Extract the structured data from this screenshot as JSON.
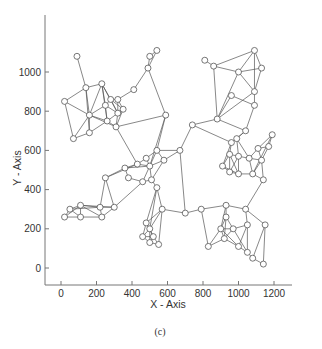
{
  "chart_data": {
    "type": "scatter",
    "subtype": "network-graph",
    "title": "",
    "caption": "(c)",
    "xlabel": "X - Axis",
    "ylabel": "Y - Axis",
    "xlim": [
      -100,
      1400
    ],
    "ylim": [
      -100,
      1250
    ],
    "xticks": [
      0,
      200,
      400,
      600,
      800,
      1000,
      1200
    ],
    "yticks": [
      0,
      200,
      400,
      600,
      800,
      1000
    ],
    "grid": false,
    "legend": null,
    "nodes": [
      {
        "id": 0,
        "x": 90,
        "y": 1080
      },
      {
        "id": 1,
        "x": 20,
        "y": 850
      },
      {
        "id": 2,
        "x": 140,
        "y": 920
      },
      {
        "id": 3,
        "x": 230,
        "y": 940
      },
      {
        "id": 4,
        "x": 160,
        "y": 780
      },
      {
        "id": 5,
        "x": 70,
        "y": 660
      },
      {
        "id": 6,
        "x": 160,
        "y": 690
      },
      {
        "id": 7,
        "x": 250,
        "y": 830
      },
      {
        "id": 8,
        "x": 280,
        "y": 860
      },
      {
        "id": 9,
        "x": 320,
        "y": 860
      },
      {
        "id": 10,
        "x": 350,
        "y": 810
      },
      {
        "id": 11,
        "x": 320,
        "y": 790
      },
      {
        "id": 12,
        "x": 260,
        "y": 750
      },
      {
        "id": 13,
        "x": 310,
        "y": 720
      },
      {
        "id": 14,
        "x": 410,
        "y": 910
      },
      {
        "id": 15,
        "x": 490,
        "y": 1020
      },
      {
        "id": 16,
        "x": 500,
        "y": 1080
      },
      {
        "id": 17,
        "x": 540,
        "y": 1110
      },
      {
        "id": 18,
        "x": 590,
        "y": 780
      },
      {
        "id": 19,
        "x": 810,
        "y": 1060
      },
      {
        "id": 20,
        "x": 860,
        "y": 1030
      },
      {
        "id": 21,
        "x": 1000,
        "y": 1000
      },
      {
        "id": 22,
        "x": 1090,
        "y": 1110
      },
      {
        "id": 23,
        "x": 1130,
        "y": 1020
      },
      {
        "id": 24,
        "x": 1090,
        "y": 900
      },
      {
        "id": 25,
        "x": 960,
        "y": 880
      },
      {
        "id": 26,
        "x": 1090,
        "y": 830
      },
      {
        "id": 27,
        "x": 1040,
        "y": 700
      },
      {
        "id": 28,
        "x": 880,
        "y": 760
      },
      {
        "id": 29,
        "x": 740,
        "y": 730
      },
      {
        "id": 30,
        "x": 990,
        "y": 660
      },
      {
        "id": 31,
        "x": 960,
        "y": 640
      },
      {
        "id": 32,
        "x": 1190,
        "y": 680
      },
      {
        "id": 33,
        "x": 1110,
        "y": 610
      },
      {
        "id": 34,
        "x": 1170,
        "y": 620
      },
      {
        "id": 35,
        "x": 950,
        "y": 580
      },
      {
        "id": 36,
        "x": 1000,
        "y": 570
      },
      {
        "id": 37,
        "x": 1060,
        "y": 560
      },
      {
        "id": 38,
        "x": 1130,
        "y": 550
      },
      {
        "id": 39,
        "x": 910,
        "y": 520
      },
      {
        "id": 40,
        "x": 950,
        "y": 490
      },
      {
        "id": 41,
        "x": 1000,
        "y": 480
      },
      {
        "id": 42,
        "x": 1080,
        "y": 480
      },
      {
        "id": 43,
        "x": 1140,
        "y": 450
      },
      {
        "id": 44,
        "x": 670,
        "y": 600
      },
      {
        "id": 45,
        "x": 580,
        "y": 550
      },
      {
        "id": 46,
        "x": 540,
        "y": 600
      },
      {
        "id": 47,
        "x": 480,
        "y": 560
      },
      {
        "id": 48,
        "x": 500,
        "y": 520
      },
      {
        "id": 49,
        "x": 430,
        "y": 530
      },
      {
        "id": 50,
        "x": 360,
        "y": 510
      },
      {
        "id": 51,
        "x": 380,
        "y": 460
      },
      {
        "id": 52,
        "x": 460,
        "y": 440
      },
      {
        "id": 53,
        "x": 510,
        "y": 450
      },
      {
        "id": 54,
        "x": 540,
        "y": 410
      },
      {
        "id": 55,
        "x": 250,
        "y": 460
      },
      {
        "id": 56,
        "x": 220,
        "y": 310
      },
      {
        "id": 57,
        "x": 300,
        "y": 310
      },
      {
        "id": 58,
        "x": 110,
        "y": 320
      },
      {
        "id": 59,
        "x": 50,
        "y": 300
      },
      {
        "id": 60,
        "x": 20,
        "y": 260
      },
      {
        "id": 61,
        "x": 110,
        "y": 260
      },
      {
        "id": 62,
        "x": 230,
        "y": 260
      },
      {
        "id": 63,
        "x": 570,
        "y": 300
      },
      {
        "id": 64,
        "x": 480,
        "y": 230
      },
      {
        "id": 65,
        "x": 500,
        "y": 200
      },
      {
        "id": 66,
        "x": 460,
        "y": 160
      },
      {
        "id": 67,
        "x": 520,
        "y": 160
      },
      {
        "id": 68,
        "x": 500,
        "y": 130
      },
      {
        "id": 69,
        "x": 550,
        "y": 120
      },
      {
        "id": 70,
        "x": 700,
        "y": 280
      },
      {
        "id": 71,
        "x": 790,
        "y": 300
      },
      {
        "id": 72,
        "x": 930,
        "y": 320
      },
      {
        "id": 73,
        "x": 1040,
        "y": 300
      },
      {
        "id": 74,
        "x": 930,
        "y": 260
      },
      {
        "id": 75,
        "x": 970,
        "y": 200
      },
      {
        "id": 76,
        "x": 900,
        "y": 200
      },
      {
        "id": 77,
        "x": 1050,
        "y": 220
      },
      {
        "id": 78,
        "x": 1150,
        "y": 220
      },
      {
        "id": 79,
        "x": 830,
        "y": 110
      },
      {
        "id": 80,
        "x": 920,
        "y": 150
      },
      {
        "id": 81,
        "x": 1000,
        "y": 110
      },
      {
        "id": 82,
        "x": 1050,
        "y": 80
      },
      {
        "id": 83,
        "x": 1080,
        "y": 50
      },
      {
        "id": 84,
        "x": 1140,
        "y": 20
      }
    ],
    "edges": [
      [
        0,
        2
      ],
      [
        1,
        2
      ],
      [
        1,
        4
      ],
      [
        1,
        5
      ],
      [
        2,
        3
      ],
      [
        2,
        4
      ],
      [
        2,
        6
      ],
      [
        3,
        4
      ],
      [
        3,
        7
      ],
      [
        3,
        8
      ],
      [
        3,
        11
      ],
      [
        3,
        12
      ],
      [
        4,
        5
      ],
      [
        4,
        6
      ],
      [
        4,
        7
      ],
      [
        4,
        12
      ],
      [
        4,
        13
      ],
      [
        5,
        6
      ],
      [
        6,
        12
      ],
      [
        7,
        8
      ],
      [
        7,
        11
      ],
      [
        7,
        12
      ],
      [
        8,
        9
      ],
      [
        8,
        10
      ],
      [
        8,
        11
      ],
      [
        9,
        10
      ],
      [
        9,
        11
      ],
      [
        9,
        14
      ],
      [
        10,
        11
      ],
      [
        10,
        13
      ],
      [
        11,
        12
      ],
      [
        11,
        13
      ],
      [
        12,
        13
      ],
      [
        13,
        18
      ],
      [
        14,
        15
      ],
      [
        15,
        16
      ],
      [
        15,
        17
      ],
      [
        16,
        17
      ],
      [
        15,
        18
      ],
      [
        13,
        49
      ],
      [
        18,
        48
      ],
      [
        18,
        46
      ],
      [
        19,
        20
      ],
      [
        20,
        21
      ],
      [
        20,
        22
      ],
      [
        20,
        28
      ],
      [
        21,
        22
      ],
      [
        21,
        23
      ],
      [
        21,
        24
      ],
      [
        21,
        28
      ],
      [
        22,
        23
      ],
      [
        22,
        24
      ],
      [
        23,
        24
      ],
      [
        24,
        26
      ],
      [
        24,
        28
      ],
      [
        25,
        26
      ],
      [
        25,
        28
      ],
      [
        26,
        27
      ],
      [
        27,
        28
      ],
      [
        28,
        29
      ],
      [
        27,
        30
      ],
      [
        27,
        31
      ],
      [
        29,
        44
      ],
      [
        29,
        31
      ],
      [
        31,
        35
      ],
      [
        30,
        36
      ],
      [
        30,
        37
      ],
      [
        31,
        39
      ],
      [
        32,
        34
      ],
      [
        32,
        33
      ],
      [
        32,
        42
      ],
      [
        33,
        34
      ],
      [
        33,
        37
      ],
      [
        33,
        38
      ],
      [
        34,
        38
      ],
      [
        35,
        36
      ],
      [
        35,
        39
      ],
      [
        35,
        40
      ],
      [
        36,
        37
      ],
      [
        36,
        41
      ],
      [
        37,
        38
      ],
      [
        37,
        42
      ],
      [
        38,
        43
      ],
      [
        39,
        40
      ],
      [
        40,
        41
      ],
      [
        41,
        42
      ],
      [
        42,
        43
      ],
      [
        39,
        41
      ],
      [
        35,
        41
      ],
      [
        36,
        40
      ],
      [
        38,
        42
      ],
      [
        43,
        73
      ],
      [
        44,
        45
      ],
      [
        44,
        46
      ],
      [
        45,
        46
      ],
      [
        45,
        48
      ],
      [
        45,
        53
      ],
      [
        46,
        47
      ],
      [
        46,
        48
      ],
      [
        47,
        48
      ],
      [
        47,
        49
      ],
      [
        48,
        49
      ],
      [
        48,
        50
      ],
      [
        48,
        52
      ],
      [
        48,
        53
      ],
      [
        49,
        50
      ],
      [
        50,
        51
      ],
      [
        50,
        55
      ],
      [
        51,
        52
      ],
      [
        52,
        53
      ],
      [
        53,
        54
      ],
      [
        54,
        63
      ],
      [
        49,
        55
      ],
      [
        55,
        56
      ],
      [
        55,
        57
      ],
      [
        52,
        57
      ],
      [
        56,
        58
      ],
      [
        56,
        57
      ],
      [
        56,
        59
      ],
      [
        57,
        58
      ],
      [
        57,
        62
      ],
      [
        58,
        59
      ],
      [
        58,
        61
      ],
      [
        58,
        60
      ],
      [
        59,
        60
      ],
      [
        59,
        61
      ],
      [
        60,
        61
      ],
      [
        61,
        62
      ],
      [
        58,
        62
      ],
      [
        62,
        56
      ],
      [
        54,
        64
      ],
      [
        54,
        65
      ],
      [
        63,
        64
      ],
      [
        63,
        65
      ],
      [
        64,
        65
      ],
      [
        64,
        66
      ],
      [
        64,
        67
      ],
      [
        65,
        66
      ],
      [
        65,
        67
      ],
      [
        65,
        68
      ],
      [
        66,
        68
      ],
      [
        67,
        68
      ],
      [
        67,
        69
      ],
      [
        68,
        69
      ],
      [
        66,
        67
      ],
      [
        63,
        70
      ],
      [
        44,
        70
      ],
      [
        63,
        69
      ],
      [
        70,
        71
      ],
      [
        71,
        72
      ],
      [
        71,
        79
      ],
      [
        72,
        73
      ],
      [
        72,
        74
      ],
      [
        72,
        76
      ],
      [
        73,
        77
      ],
      [
        73,
        78
      ],
      [
        74,
        75
      ],
      [
        74,
        76
      ],
      [
        75,
        77
      ],
      [
        75,
        76
      ],
      [
        75,
        80
      ],
      [
        76,
        80
      ],
      [
        76,
        79
      ],
      [
        77,
        82
      ],
      [
        78,
        84
      ],
      [
        78,
        83
      ],
      [
        80,
        81
      ],
      [
        81,
        82
      ],
      [
        82,
        83
      ],
      [
        83,
        84
      ],
      [
        76,
        81
      ],
      [
        74,
        80
      ],
      [
        75,
        82
      ],
      [
        79,
        80
      ],
      [
        77,
        81
      ]
    ]
  },
  "figure": {
    "caption": "(c)"
  }
}
